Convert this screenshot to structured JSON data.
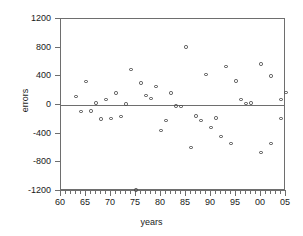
{
  "chart_data": {
    "type": "scatter",
    "title": "",
    "xlabel": "years",
    "ylabel": "errors",
    "xlim": [
      60,
      105
    ],
    "ylim": [
      -1200,
      1200
    ],
    "grid": false,
    "legend": null,
    "reference_lines": [
      {
        "axis": "y",
        "value": 0
      }
    ],
    "x_tick_labels": [
      "60",
      "65",
      "70",
      "75",
      "80",
      "85",
      "90",
      "95",
      "00",
      "05"
    ],
    "x_tick_values": [
      60,
      65,
      70,
      75,
      80,
      85,
      90,
      95,
      100,
      105
    ],
    "x_minor_tick_step": 1,
    "y_tick_labels": [
      "1200",
      "800",
      "400",
      "0",
      "-400",
      "-800",
      "-1200"
    ],
    "y_tick_values": [
      1200,
      800,
      400,
      0,
      -400,
      -800,
      -1200
    ],
    "marker": "open-circle",
    "marker_color": "#4a4a4a",
    "series": [
      {
        "name": "errors",
        "points": [
          {
            "x": 63,
            "y": 120
          },
          {
            "x": 64,
            "y": -90
          },
          {
            "x": 65,
            "y": 325
          },
          {
            "x": 66,
            "y": -85
          },
          {
            "x": 67,
            "y": 30
          },
          {
            "x": 68,
            "y": -195
          },
          {
            "x": 69,
            "y": 75
          },
          {
            "x": 70,
            "y": -185
          },
          {
            "x": 71,
            "y": 165
          },
          {
            "x": 72,
            "y": -160
          },
          {
            "x": 73,
            "y": 15
          },
          {
            "x": 74,
            "y": 495
          },
          {
            "x": 75,
            "y": -1185
          },
          {
            "x": 76,
            "y": 305
          },
          {
            "x": 77,
            "y": 135
          },
          {
            "x": 78,
            "y": 90
          },
          {
            "x": 79,
            "y": 260
          },
          {
            "x": 80,
            "y": -355
          },
          {
            "x": 81,
            "y": -220
          },
          {
            "x": 82,
            "y": 165
          },
          {
            "x": 83,
            "y": -15
          },
          {
            "x": 84,
            "y": -20
          },
          {
            "x": 85,
            "y": 810
          },
          {
            "x": 86,
            "y": -595
          },
          {
            "x": 87,
            "y": -155
          },
          {
            "x": 88,
            "y": -215
          },
          {
            "x": 89,
            "y": 425
          },
          {
            "x": 90,
            "y": -315
          },
          {
            "x": 91,
            "y": -180
          },
          {
            "x": 92,
            "y": -440
          },
          {
            "x": 93,
            "y": 540
          },
          {
            "x": 94,
            "y": -540
          },
          {
            "x": 95,
            "y": 335
          },
          {
            "x": 96,
            "y": 75
          },
          {
            "x": 97,
            "y": 25
          },
          {
            "x": 98,
            "y": 30
          },
          {
            "x": 100,
            "y": 570
          },
          {
            "x": 100,
            "y": -660
          },
          {
            "x": 102,
            "y": 405
          },
          {
            "x": 102,
            "y": -535
          },
          {
            "x": 104,
            "y": 80
          },
          {
            "x": 104,
            "y": -185
          },
          {
            "x": 105,
            "y": 175
          }
        ]
      }
    ]
  }
}
